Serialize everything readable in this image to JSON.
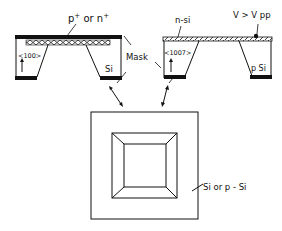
{
  "diagram": {
    "colors": {
      "ink": "#111111",
      "background": "#ffffff"
    },
    "left_chip": {
      "top_label": "p",
      "top_label_sup1": "+",
      "top_label_or": " or n",
      "top_label_sup2": "+",
      "orientation": "<100>",
      "material": "Si"
    },
    "mask_label": "Mask",
    "right_chip": {
      "top_label": "n-si",
      "orientation": "<1007>",
      "voltage_label": "V > V pp",
      "material": "p Si"
    },
    "plan_view": {
      "label": "Si or p - Si"
    }
  }
}
